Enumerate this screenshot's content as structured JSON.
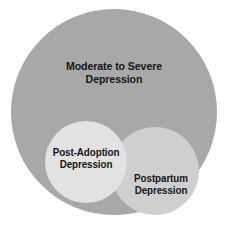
{
  "diagram": {
    "type": "venn",
    "background_color": "#ffffff",
    "text_color": "#171717",
    "canvas": {
      "width": 230,
      "height": 227
    },
    "sets": [
      {
        "id": "moderate-severe-depression",
        "label_lines": [
          "Moderate to Severe",
          "Depression"
        ],
        "label_full": "Moderate to Severe Depression",
        "color": "#a8a8a8",
        "cx": 114,
        "cy": 112,
        "r": 103,
        "z": 1
      },
      {
        "id": "postpartum-depression",
        "label_lines": [
          "Postpartum",
          "Depression"
        ],
        "label_full": "Postpartum Depression",
        "color": "#cfcfcf",
        "cx": 155,
        "cy": 171,
        "r": 44,
        "z": 2
      },
      {
        "id": "post-adoption-depression",
        "label_lines": [
          "Post-Adoption",
          "Depression"
        ],
        "label_full": "Post-Adoption Depression",
        "color": "#e2e2e2",
        "cx": 86,
        "cy": 162,
        "r": 41,
        "z": 3
      }
    ]
  }
}
